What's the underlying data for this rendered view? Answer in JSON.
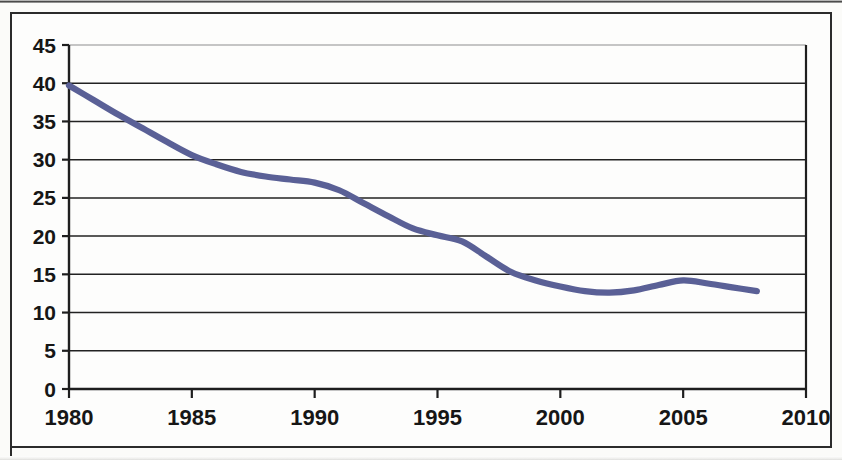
{
  "chart_data": {
    "type": "line",
    "title": "",
    "subtitle": "",
    "xlabel": "",
    "ylabel": "",
    "xlim": [
      1980,
      2010
    ],
    "ylim": [
      0,
      45
    ],
    "grid": true,
    "grid_axis": "y",
    "legend": false,
    "legend_position": "none",
    "series_color": "#5a6096",
    "x_ticks": [
      1980,
      1985,
      1990,
      1995,
      2000,
      2005,
      2010
    ],
    "x_tick_labels": [
      "1980",
      "1985",
      "1990",
      "1995",
      "2000",
      "2005",
      "2010"
    ],
    "y_ticks": [
      0,
      5,
      10,
      15,
      20,
      25,
      30,
      35,
      40,
      45
    ],
    "y_tick_labels": [
      "0",
      "5",
      "10",
      "15",
      "20",
      "25",
      "30",
      "35",
      "40",
      "45"
    ],
    "x": [
      1980,
      1981,
      1982,
      1983,
      1984,
      1985,
      1986,
      1987,
      1988,
      1989,
      1990,
      1991,
      1992,
      1993,
      1994,
      1995,
      1996,
      1997,
      1998,
      1999,
      2000,
      2001,
      2002,
      2003,
      2004,
      2005,
      2006,
      2007,
      2008
    ],
    "values": [
      39.7,
      37.8,
      35.9,
      34.1,
      32.3,
      30.6,
      29.4,
      28.4,
      27.8,
      27.4,
      27.0,
      26.0,
      24.3,
      22.6,
      21.0,
      20.1,
      19.3,
      17.3,
      15.3,
      14.2,
      13.4,
      12.8,
      12.6,
      12.9,
      13.6,
      14.2,
      13.8,
      13.3,
      12.8
    ],
    "series": [
      {
        "name": "series-1",
        "color": "#5a6096",
        "values": [
          39.7,
          37.8,
          35.9,
          34.1,
          32.3,
          30.6,
          29.4,
          28.4,
          27.8,
          27.4,
          27.0,
          26.0,
          24.3,
          22.6,
          21.0,
          20.1,
          19.3,
          17.3,
          15.3,
          14.2,
          13.4,
          12.8,
          12.6,
          12.9,
          13.6,
          14.2,
          13.8,
          13.3,
          12.8
        ]
      }
    ],
    "annotations": []
  }
}
